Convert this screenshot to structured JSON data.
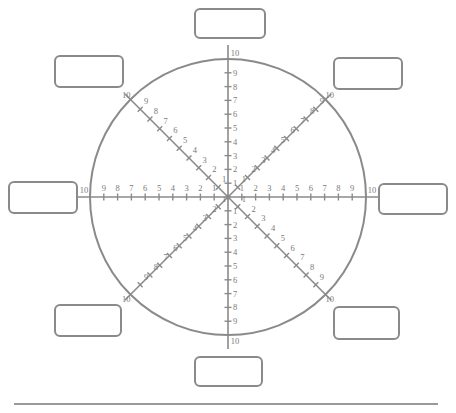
{
  "diagram": {
    "type": "radial-scale-worksheet",
    "center": [
      228,
      197
    ],
    "radius": 138,
    "stroke_color": "#8a8a8a",
    "label_color": "#7a7a7a",
    "spokes": [
      {
        "name": "north",
        "angle_deg": -90
      },
      {
        "name": "north-east",
        "angle_deg": -45
      },
      {
        "name": "east",
        "angle_deg": 0
      },
      {
        "name": "south-east",
        "angle_deg": 45
      },
      {
        "name": "south",
        "angle_deg": 90
      },
      {
        "name": "south-west",
        "angle_deg": 135
      },
      {
        "name": "west",
        "angle_deg": 180
      },
      {
        "name": "north-west",
        "angle_deg": -135
      }
    ],
    "tick_labels": [
      "1",
      "2",
      "3",
      "4",
      "5",
      "6",
      "7",
      "8",
      "9"
    ],
    "rim_label": "10",
    "boxes": [
      {
        "name": "north",
        "x": 194,
        "y": 8,
        "w": 72,
        "h": 31,
        "text": ""
      },
      {
        "name": "north-east",
        "x": 333,
        "y": 57,
        "w": 70,
        "h": 33,
        "text": ""
      },
      {
        "name": "east",
        "x": 378,
        "y": 183,
        "w": 70,
        "h": 32,
        "text": ""
      },
      {
        "name": "south-east",
        "x": 333,
        "y": 306,
        "w": 67,
        "h": 34,
        "text": ""
      },
      {
        "name": "south",
        "x": 194,
        "y": 356,
        "w": 69,
        "h": 31,
        "text": ""
      },
      {
        "name": "south-west",
        "x": 54,
        "y": 304,
        "w": 68,
        "h": 33,
        "text": ""
      },
      {
        "name": "west",
        "x": 8,
        "y": 181,
        "w": 70,
        "h": 33,
        "text": ""
      },
      {
        "name": "north-west",
        "x": 54,
        "y": 55,
        "w": 70,
        "h": 33,
        "text": ""
      }
    ],
    "answer_line": {
      "x1": 14,
      "x2": 438,
      "y": 403,
      "text": ""
    }
  }
}
